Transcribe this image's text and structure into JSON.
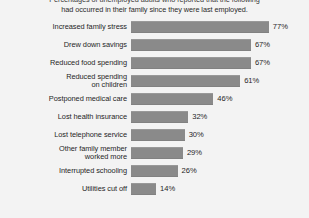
{
  "chart_data": {
    "type": "bar",
    "orientation": "horizontal",
    "title": "Percentages of unemployed adults who reported that the following had occurred in their family since they were last employed",
    "title_lines": [
      "Percentages of unemployed adults who reported that the following",
      "had occurred in their family since they were last employed."
    ],
    "xlabel": "",
    "ylabel": "",
    "xlim": [
      0,
      80
    ],
    "grid": false,
    "legend": null,
    "value_suffix": "%",
    "bar_color": "#8a8a8a",
    "background_color": "#f3f3f3",
    "text_color": "#1f1f1f",
    "categories": [
      "Increased family stress",
      "Drew down savings",
      "Reduced food spending",
      "Reduced spending\non children",
      "Postponed medical care",
      "Lost health insurance",
      "Lost telephone service",
      "Other family member\nworked more",
      "Interrupted schooling",
      "Utilities cut off"
    ],
    "values": [
      77,
      67,
      67,
      61,
      46,
      32,
      30,
      29,
      26,
      14
    ],
    "value_labels": [
      "77%",
      "67%",
      "67%",
      "61%",
      "46%",
      "32%",
      "30%",
      "29%",
      "26%",
      "14%"
    ]
  }
}
